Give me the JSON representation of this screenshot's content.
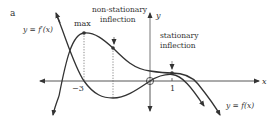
{
  "figure": {
    "panel_label": "a",
    "axes": {
      "x_label": "x",
      "y_label": "y"
    },
    "curves": {
      "f": {
        "label": "y = f(x)",
        "color": "#333333"
      },
      "f_prime": {
        "label": "y = f′(x)",
        "color": "#333333"
      }
    },
    "annotations": {
      "max": "max",
      "non_stationary_line1": "non-stationary",
      "non_stationary_line2": "inflection",
      "stationary_line1": "stationary",
      "stationary_line2": "inflection"
    },
    "ticks": {
      "neg3": "−3",
      "one": "1"
    }
  }
}
